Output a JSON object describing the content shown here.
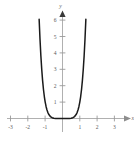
{
  "figure": {
    "title": "",
    "background_color": "#ffffff",
    "width": 134,
    "height": 142
  },
  "axes": {
    "x_axis": {
      "label": "x",
      "color": "#b0b0b0",
      "arrow": "right-arrowhead",
      "tick_labels": [
        "-3",
        "-2",
        "-1",
        "1",
        "2",
        "3"
      ],
      "tick_values": [
        -3,
        -2,
        -1,
        1,
        2,
        3
      ]
    },
    "y_axis": {
      "label": "y",
      "color": "#b0b0b0",
      "arrow": "up-arrowhead",
      "tick_labels": [
        "1",
        "2",
        "3",
        "4",
        "5",
        "6"
      ],
      "tick_values": [
        1,
        2,
        3,
        4,
        5,
        6
      ]
    },
    "tick_color": "#9a9a9a",
    "label_color": "#5a5a5a"
  },
  "chart_data": {
    "type": "line",
    "title": "",
    "xlabel": "x",
    "ylabel": "y",
    "xlim": [
      -3.4,
      3.4
    ],
    "ylim": [
      -0.5,
      6.8
    ],
    "grid": false,
    "legend": null,
    "curve_color": "#1a1a1a",
    "curve_width": 1.5,
    "function": "y = x^6",
    "series": [
      {
        "name": "y = x^6",
        "x": [
          -1.72,
          -1.65,
          -1.6,
          -1.55,
          -1.5,
          -1.45,
          -1.4,
          -1.35,
          -1.3,
          -1.25,
          -1.2,
          -1.15,
          -1.1,
          -1.05,
          -1.0,
          -0.95,
          -0.9,
          -0.85,
          -0.8,
          -0.7,
          -0.6,
          -0.5,
          -0.4,
          -0.3,
          -0.2,
          -0.1,
          0.0,
          0.1,
          0.2,
          0.3,
          0.4,
          0.5,
          0.6,
          0.7,
          0.8,
          0.85,
          0.9,
          0.95,
          1.0,
          1.05,
          1.1,
          1.15,
          1.2,
          1.25,
          1.3,
          1.35,
          1.4,
          1.45,
          1.5,
          1.55,
          1.6,
          1.65,
          1.72
        ],
        "y": [
          25.9,
          20.2,
          16.8,
          13.9,
          11.4,
          9.29,
          7.53,
          6.05,
          4.83,
          3.81,
          2.99,
          2.31,
          1.77,
          1.34,
          1.0,
          0.735,
          0.531,
          0.377,
          0.262,
          0.118,
          0.047,
          0.016,
          0.004,
          0.001,
          0.0,
          0.0,
          0.0,
          0.0,
          0.0,
          0.001,
          0.004,
          0.016,
          0.047,
          0.118,
          0.262,
          0.377,
          0.531,
          0.735,
          1.0,
          1.34,
          1.77,
          2.31,
          2.99,
          3.81,
          4.83,
          6.05,
          7.53,
          9.29,
          11.4,
          13.9,
          16.8,
          20.2,
          25.9
        ]
      }
    ]
  }
}
